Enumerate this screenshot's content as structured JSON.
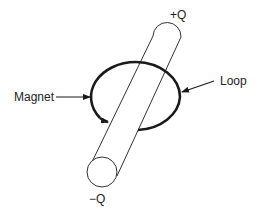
{
  "diagram": {
    "labels": {
      "plus_q": "+Q",
      "minus_q": "−Q",
      "magnet": "Magnet",
      "loop": "Loop"
    },
    "colors": {
      "stroke": "#1a1a1a",
      "text": "#222222",
      "background": "#ffffff"
    }
  }
}
